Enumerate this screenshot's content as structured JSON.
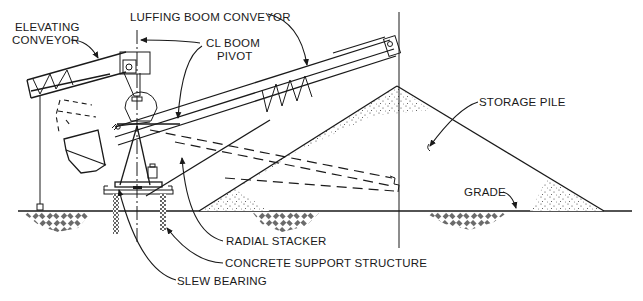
{
  "diagram": {
    "type": "radial-stacker-elevation",
    "colors": {
      "line": "#1a1a1a",
      "background": "#ffffff"
    },
    "labels": {
      "elevating_conveyor_line1": "ELEVATING",
      "elevating_conveyor_line2": "CONVEYOR",
      "luffing_boom_conveyor": "LUFFING BOOM CONVEYOR",
      "cl_boom_pivot_line1": "CL BOOM",
      "cl_boom_pivot_line2": "PIVOT",
      "storage_pile": "STORAGE PILE",
      "grade": "GRADE",
      "radial_stacker": "RADIAL STACKER",
      "concrete_support_structure": "CONCRETE SUPPORT STRUCTURE",
      "slew_bearing": "SLEW BEARING"
    }
  }
}
